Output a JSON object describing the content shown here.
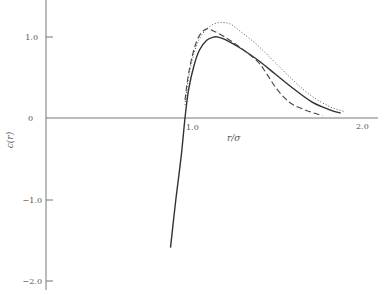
{
  "chart_data": {
    "type": "line",
    "title": "",
    "xlabel": "r/σ",
    "ylabel": "c(r)",
    "xlim": [
      0.25,
      2.05
    ],
    "ylim": [
      -2.1,
      1.45
    ],
    "x_ticks": [
      {
        "value": 1.0,
        "label": "1.0"
      },
      {
        "value": 2.0,
        "label": "2.0"
      }
    ],
    "y_ticks": [
      {
        "value": 1.0,
        "label": "1.0"
      },
      {
        "value": 0,
        "label": "0"
      },
      {
        "value": -1.0,
        "label": "−1.0"
      },
      {
        "value": -2.0,
        "label": "−2.0"
      }
    ],
    "grid": false,
    "legend": null,
    "series": [
      {
        "name": "solid",
        "style": "solid",
        "x": [
          0.92,
          0.95,
          0.98,
          1.0,
          1.02,
          1.05,
          1.08,
          1.12,
          1.16,
          1.18,
          1.22,
          1.3,
          1.4,
          1.5,
          1.6,
          1.7,
          1.8,
          1.86
        ],
        "y": [
          -1.6,
          -1.0,
          -0.45,
          0.0,
          0.35,
          0.65,
          0.84,
          0.96,
          1.0,
          1.0,
          0.97,
          0.87,
          0.72,
          0.54,
          0.36,
          0.2,
          0.1,
          0.06
        ]
      },
      {
        "name": "dashed",
        "style": "dashed",
        "x": [
          1.0,
          1.02,
          1.05,
          1.08,
          1.12,
          1.16,
          1.22,
          1.3,
          1.4,
          1.45,
          1.5,
          1.55,
          1.6,
          1.7,
          1.76
        ],
        "y": [
          0.22,
          0.55,
          0.85,
          1.02,
          1.1,
          1.07,
          1.0,
          0.88,
          0.7,
          0.55,
          0.38,
          0.25,
          0.16,
          0.07,
          0.03
        ]
      },
      {
        "name": "dotted",
        "style": "dotted",
        "x": [
          1.0,
          1.02,
          1.05,
          1.08,
          1.12,
          1.16,
          1.2,
          1.25,
          1.3,
          1.4,
          1.5,
          1.6,
          1.7,
          1.8,
          1.88
        ],
        "y": [
          0.16,
          0.5,
          0.8,
          0.98,
          1.1,
          1.16,
          1.18,
          1.16,
          1.08,
          0.9,
          0.68,
          0.46,
          0.27,
          0.14,
          0.08
        ]
      }
    ]
  }
}
